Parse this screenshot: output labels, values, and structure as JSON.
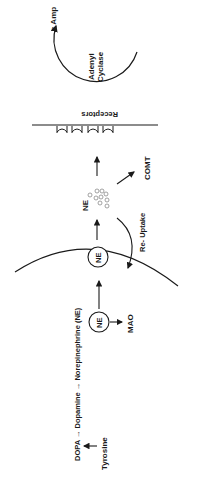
{
  "diagram": {
    "orientation": "rotated-90",
    "colors": {
      "ink": "#1a1a1a",
      "dot": "#8a8a8a",
      "background": "#ffffff"
    },
    "labels": {
      "c_amp": "c Amp",
      "adenyl": "Adenyl",
      "cyclase": "Cyclase",
      "receptors": "Receptors",
      "comt": "COMT",
      "ne_released": "NE",
      "re_uptake": "Re- Uptake",
      "ne_vesicle_membrane": "NE",
      "ne_vesicle_storage": "NE",
      "mao": "MAO",
      "synthesis_pathway": "DOPA → Dopamine → Norepinephrine  (NE)",
      "tyrosine": "Tyrosine"
    },
    "receptor_count": 4
  }
}
